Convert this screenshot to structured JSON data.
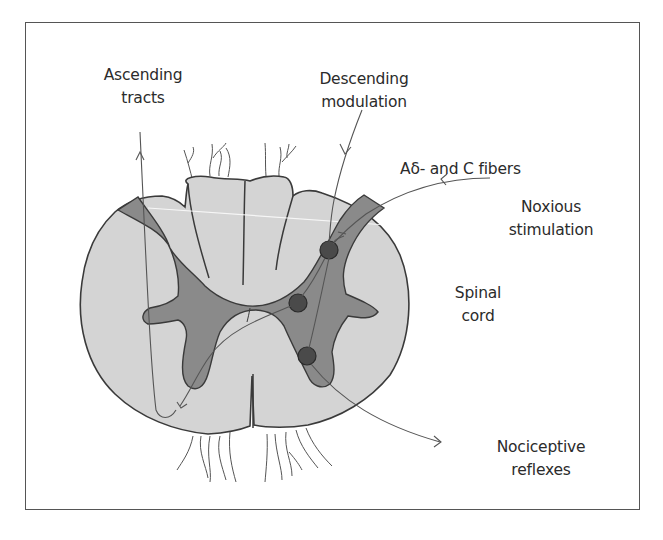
{
  "figure": {
    "colors": {
      "white_matter": "#d4d4d4",
      "gray_matter": "#8a8a8a",
      "neuron": "#4a4a4a",
      "outline": "#3a3a3a",
      "line": "#555555",
      "frame": "#555555",
      "text": "#2b2b2b"
    }
  },
  "labels": {
    "ascending": {
      "line1": "Ascending",
      "line2": "tracts"
    },
    "descending": {
      "line1": "Descending",
      "line2": "modulation"
    },
    "fibers": {
      "text": "Aδ- and C fibers"
    },
    "noxious": {
      "line1": "Noxious",
      "line2": "stimulation"
    },
    "spinal": {
      "line1": "Spinal",
      "line2": "cord"
    },
    "reflexes": {
      "line1": "Nociceptive",
      "line2": "reflexes"
    }
  },
  "neurons": [
    {
      "name": "dorsal-horn-neuron",
      "cx": 329,
      "cy": 250,
      "r": 9
    },
    {
      "name": "interneuron",
      "cx": 298,
      "cy": 303,
      "r": 9
    },
    {
      "name": "ventral-horn-neuron",
      "cx": 307,
      "cy": 356,
      "r": 9
    }
  ]
}
